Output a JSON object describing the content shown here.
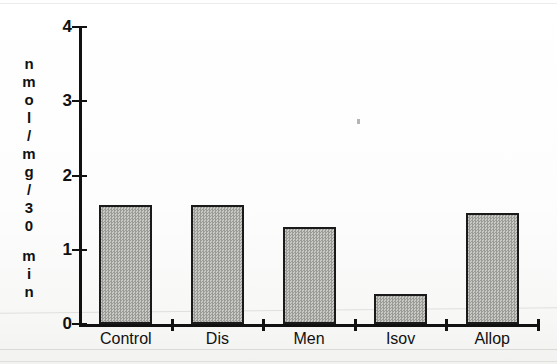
{
  "chart_data": {
    "type": "bar",
    "title": "",
    "subtitle": "",
    "xlabel": "",
    "ylabel": "nmol/mg/30 min",
    "ylabel_chars": [
      "n",
      "m",
      "o",
      "l",
      "/",
      "m",
      "g",
      "/",
      "3",
      "0",
      " ",
      "m",
      "i",
      "n"
    ],
    "categories": [
      "Control",
      "Dis",
      "Men",
      "Isov",
      "Allop"
    ],
    "values": [
      1.6,
      1.6,
      1.3,
      0.4,
      1.5
    ],
    "ylim": [
      0,
      4
    ],
    "ytick_labels": [
      "0",
      "1",
      "2",
      "3",
      "4"
    ],
    "ytick_values": [
      0,
      1,
      2,
      3,
      4
    ],
    "grid": false,
    "legend": null,
    "legend_position": "none",
    "annotations": [],
    "bar_fill": "#b3b3b0",
    "bar_edge": "#1a1a1a",
    "axis_color": "#111111",
    "background": "#ffffff"
  }
}
